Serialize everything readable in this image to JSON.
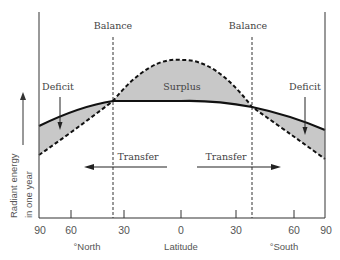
{
  "diagram": {
    "labels": {
      "balance_left": "Balance",
      "balance_right": "Balance",
      "surplus": "Surplus",
      "deficit_left": "Deficit",
      "deficit_right": "Deficit",
      "transfer_left": "Transfer",
      "transfer_right": "Transfer"
    },
    "y_axis": {
      "label_line1": "Radiant energy",
      "label_line2": "in one year"
    },
    "x_axis": {
      "title": "Latitude",
      "north": "°North",
      "south": "°South",
      "ticks": [
        "90",
        "60",
        "30",
        "0",
        "30",
        "60",
        "90"
      ]
    },
    "series": [
      {
        "name": "outgoing radiation",
        "style": "solid"
      },
      {
        "name": "incoming radiation",
        "style": "dashed"
      }
    ],
    "colors": {
      "fill": "#c8c8c8",
      "line": "#111111",
      "axis": "#555555"
    }
  }
}
